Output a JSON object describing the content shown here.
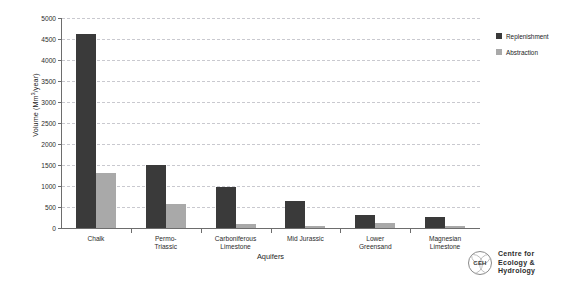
{
  "chart_data": {
    "type": "bar",
    "title": "",
    "xlabel": "Aquifers",
    "ylabel": "Volume (Mm³/year)",
    "ylabel_prefix": "Volume (Mm",
    "ylabel_sup": "3",
    "ylabel_suffix": "/year)",
    "ylim": [
      0,
      5000
    ],
    "ytick_values": [
      0,
      500,
      1000,
      1500,
      2000,
      2500,
      3000,
      3500,
      4000,
      4500,
      5000
    ],
    "ytick_labels": [
      "0",
      "500",
      "1000",
      "1500",
      "2000",
      "2500",
      "3000",
      "3500",
      "4000",
      "4500",
      "5000"
    ],
    "grid": true,
    "grid_axis": "y",
    "grid_style": "dashed",
    "legend_position": "right",
    "categories": [
      "Chalk",
      "Permo-\nTriassic",
      "Carboniferous\nLimestone",
      "Mid Jurassic",
      "Lower\nGreensand",
      "Magnesian\nLimestone"
    ],
    "category_lines": [
      [
        "Chalk"
      ],
      [
        "Permo-",
        "Triassic"
      ],
      [
        "Carboniferous",
        "Limestone"
      ],
      [
        "Mid Jurassic"
      ],
      [
        "Lower",
        "Greensand"
      ],
      [
        "Magnesian",
        "Limestone"
      ]
    ],
    "series": [
      {
        "name": "Replenishment",
        "color": "#3a3a3a",
        "values": [
          4620,
          1500,
          980,
          640,
          300,
          270
        ]
      },
      {
        "name": "Abstraction",
        "color": "#a9a9a9",
        "values": [
          1320,
          580,
          100,
          50,
          120,
          50
        ]
      }
    ]
  },
  "legend": {
    "items": [
      {
        "label": "Replenishment",
        "color": "#3a3a3a"
      },
      {
        "label": "Abstraction",
        "color": "#a9a9a9"
      }
    ]
  },
  "logo": {
    "mark_text": "CEH",
    "line1": "Centre for",
    "line2": "Ecology &",
    "line3": "Hydrology"
  }
}
